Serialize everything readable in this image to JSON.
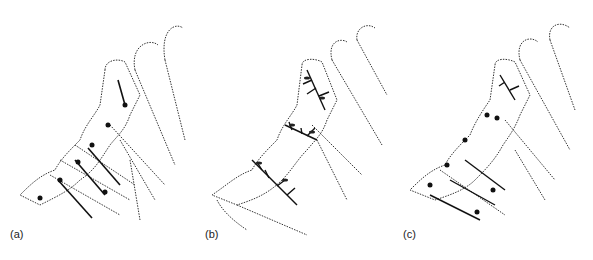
{
  "figure": {
    "panels": [
      {
        "id": "a",
        "label": "(a)",
        "description": "Leaf primordium with radial venation centres along segments"
      },
      {
        "id": "b",
        "label": "(b)",
        "description": "Leaf primordium with branching dendritic venation pattern"
      },
      {
        "id": "c",
        "label": "(c)",
        "description": "Leaf primordium with combined radial and branching venation"
      }
    ],
    "colors": {
      "ink": "#1a1a1a",
      "stipple": "#555555",
      "background": "#ffffff"
    }
  }
}
